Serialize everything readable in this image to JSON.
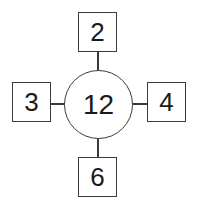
{
  "diagram": {
    "type": "number-bond-spider-diagram",
    "background_color": "#ffffff",
    "stroke_color": "#3a3a3a",
    "text_color": "#1a1a1a",
    "center": {
      "label": "12",
      "shape": "circle"
    },
    "nodes": [
      {
        "position": "top",
        "label": "2",
        "shape": "square"
      },
      {
        "position": "left",
        "label": "3",
        "shape": "square"
      },
      {
        "position": "right",
        "label": "4",
        "shape": "square"
      },
      {
        "position": "bottom",
        "label": "6",
        "shape": "square"
      }
    ],
    "edges": [
      {
        "from": "center",
        "to": "top",
        "orientation": "vertical"
      },
      {
        "from": "center",
        "to": "left",
        "orientation": "horizontal"
      },
      {
        "from": "center",
        "to": "right",
        "orientation": "horizontal"
      },
      {
        "from": "center",
        "to": "bottom",
        "orientation": "vertical"
      }
    ]
  }
}
